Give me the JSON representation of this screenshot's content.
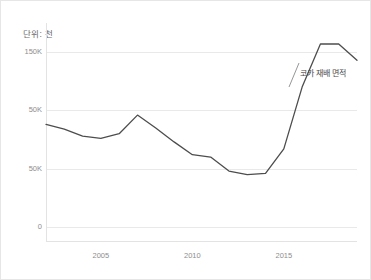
{
  "figure": {
    "width": 371,
    "height": 280,
    "background": "#ffffff",
    "border_color": "#e6e6e6"
  },
  "chart_data": {
    "type": "line",
    "title": "단위: 천",
    "xlabel": "",
    "ylabel": "",
    "unit_note": "단위: 천",
    "grid": true,
    "legend_position": "inline-annotation",
    "xlim": [
      2002,
      2019
    ],
    "ylim": [
      0,
      175
    ],
    "x_ticks": [
      2005,
      2010,
      2015
    ],
    "x_tick_labels": [
      "2005",
      "2010",
      "2015"
    ],
    "y_ticks": [
      0,
      50,
      100,
      150
    ],
    "y_tick_labels": [
      "0",
      "50K",
      "50K",
      "150K"
    ],
    "series": [
      {
        "name": "코카 재배 면적",
        "color": "#4d4d4d",
        "x": [
          2002,
          2003,
          2004,
          2005,
          2006,
          2007,
          2008,
          2009,
          2010,
          2011,
          2012,
          2013,
          2014,
          2015,
          2016,
          2017,
          2018,
          2019
        ],
        "values": [
          88,
          84,
          78,
          76,
          80,
          96,
          85,
          73,
          62,
          60,
          48,
          45,
          46,
          67,
          120,
          157,
          157,
          143
        ]
      }
    ],
    "annotations": [
      {
        "text": "코카 재배 면적",
        "x": 2017.1,
        "y": 130
      }
    ]
  },
  "axis": {
    "y_labels": [
      {
        "text": "150K",
        "value": 150
      },
      {
        "text": "50K",
        "value": 100
      },
      {
        "text": "50K",
        "value": 50
      },
      {
        "text": "0",
        "value": 0
      }
    ],
    "x_labels": [
      {
        "text": "2005",
        "value": 2005
      },
      {
        "text": "2010",
        "value": 2010
      },
      {
        "text": "2015",
        "value": 2015
      }
    ]
  }
}
